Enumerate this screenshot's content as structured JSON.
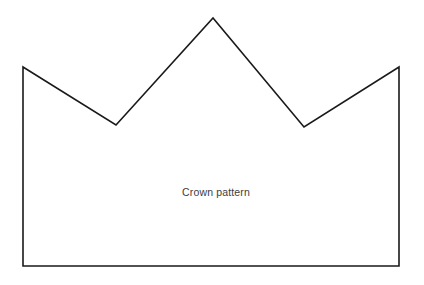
{
  "page": {
    "title": "Crown pattern",
    "background_color": "#ffffff",
    "width": 424,
    "height": 285
  },
  "figure": {
    "name": "crown-pattern",
    "label": "Crown pattern",
    "label_color": "#3d3d3d",
    "outline_color": "#1a1a1a",
    "fill_color": "#ffffff",
    "stroke_width": 1.6,
    "points": "23,67 116,125 213,18 304,127 399,67 399,266 23,266",
    "vertices": [
      {
        "name": "left-peak",
        "x": 23,
        "y": 67
      },
      {
        "name": "left-valley",
        "x": 116,
        "y": 125
      },
      {
        "name": "center-peak",
        "x": 213,
        "y": 18
      },
      {
        "name": "right-valley",
        "x": 304,
        "y": 127
      },
      {
        "name": "right-peak",
        "x": 399,
        "y": 67
      },
      {
        "name": "bottom-right-corner",
        "x": 399,
        "y": 266
      },
      {
        "name": "bottom-left-corner",
        "x": 23,
        "y": 266
      }
    ]
  }
}
